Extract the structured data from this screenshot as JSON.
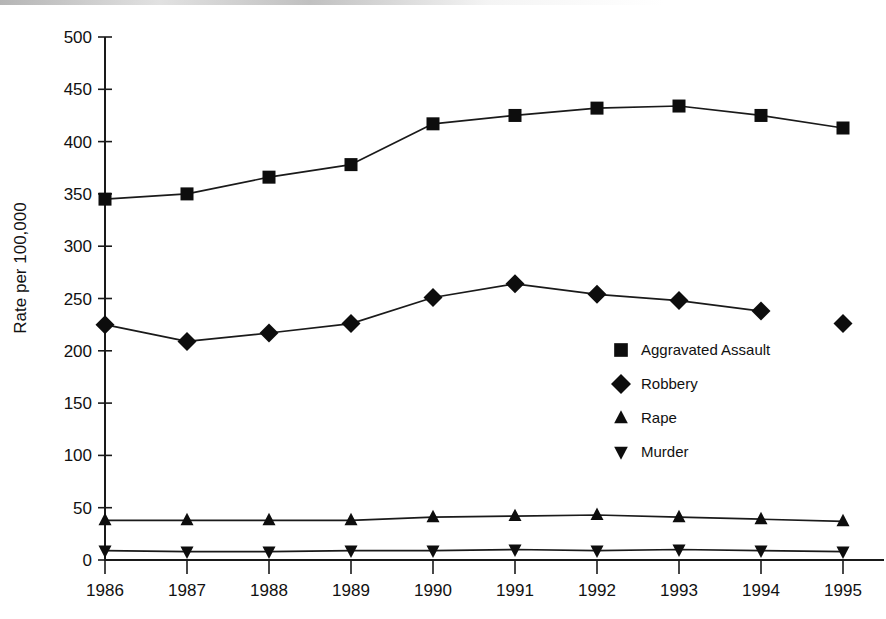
{
  "chart_data": {
    "type": "line",
    "title": "",
    "subtitle": "",
    "xlabel": "",
    "ylabel": "Rate per 100,000",
    "x": [
      1986,
      1987,
      1988,
      1989,
      1990,
      1991,
      1992,
      1993,
      1994,
      1995
    ],
    "categories": [
      "1986",
      "1987",
      "1988",
      "1989",
      "1990",
      "1991",
      "1992",
      "1993",
      "1994",
      "1995"
    ],
    "series": [
      {
        "name": "Aggravated Assault",
        "marker": "square",
        "color": "#0d0d0d",
        "values": [
          345,
          350,
          366,
          378,
          417,
          425,
          432,
          434,
          425,
          413
        ]
      },
      {
        "name": "Robbery",
        "marker": "diamond",
        "color": "#0d0d0d",
        "values": [
          225,
          209,
          217,
          226,
          251,
          264,
          254,
          248,
          238,
          226
        ],
        "line_gap_after_index": 8
      },
      {
        "name": "Rape",
        "marker": "triangle-up",
        "color": "#0d0d0d",
        "values": [
          38,
          38,
          38,
          38,
          41,
          42,
          43,
          41,
          39,
          37
        ]
      },
      {
        "name": "Murder",
        "marker": "triangle-down",
        "color": "#0d0d0d",
        "values": [
          9,
          8,
          8,
          9,
          9,
          10,
          9,
          10,
          9,
          8
        ]
      }
    ],
    "ylim": [
      0,
      500
    ],
    "yticks": [
      0,
      50,
      100,
      150,
      200,
      250,
      300,
      350,
      400,
      450,
      500
    ],
    "ytick_labels": [
      "0",
      "50",
      "100",
      "150",
      "200",
      "250",
      "300",
      "350",
      "400",
      "450",
      "500"
    ],
    "xlim": [
      1986,
      1995
    ],
    "grid": false,
    "legend_position": "center-right",
    "legend_entries": [
      "Aggravated Assault",
      "Robbery",
      "Rape",
      "Murder"
    ]
  },
  "axes": {
    "y_title": "Rate per 100,000"
  },
  "legend": {
    "items": [
      {
        "label": "Aggravated Assault",
        "marker": "square"
      },
      {
        "label": "Robbery",
        "marker": "diamond"
      },
      {
        "label": "Rape",
        "marker": "triangle-up"
      },
      {
        "label": "Murder",
        "marker": "triangle-down"
      }
    ]
  }
}
